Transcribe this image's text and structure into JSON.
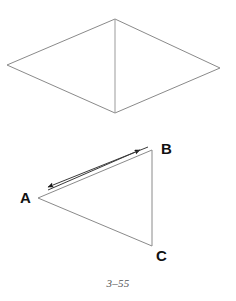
{
  "figure": {
    "caption": "3–55",
    "stroke_color": "#8a8a8a",
    "arrow_color": "#1a1a1a",
    "label_color": "#111111",
    "background_color": "#ffffff",
    "stroke_width": 1,
    "shapes": {
      "rhombus": {
        "name": "rhombus-with-vertical-diagonal",
        "points": "115,19 220,68 115,113 7,65",
        "diagonal": {
          "x1": 115,
          "y1": 19,
          "x2": 115,
          "y2": 113
        }
      },
      "triangle": {
        "name": "triangle-abc",
        "points": "38,198 152,150 152,246",
        "vertices": {
          "A": {
            "x": 38,
            "y": 198
          },
          "B": {
            "x": 152,
            "y": 150
          },
          "C": {
            "x": 152,
            "y": 246
          }
        }
      },
      "arrows": [
        {
          "name": "arrow-a-to-b",
          "direction": "A to B",
          "x1": 48,
          "y1": 190,
          "x2": 140,
          "y2": 150
        },
        {
          "name": "arrow-b-to-a",
          "direction": "B to A",
          "x1": 148,
          "y1": 147,
          "x2": 48,
          "y2": 187
        }
      ]
    },
    "labels": {
      "A": "A",
      "B": "B",
      "C": "C"
    }
  }
}
